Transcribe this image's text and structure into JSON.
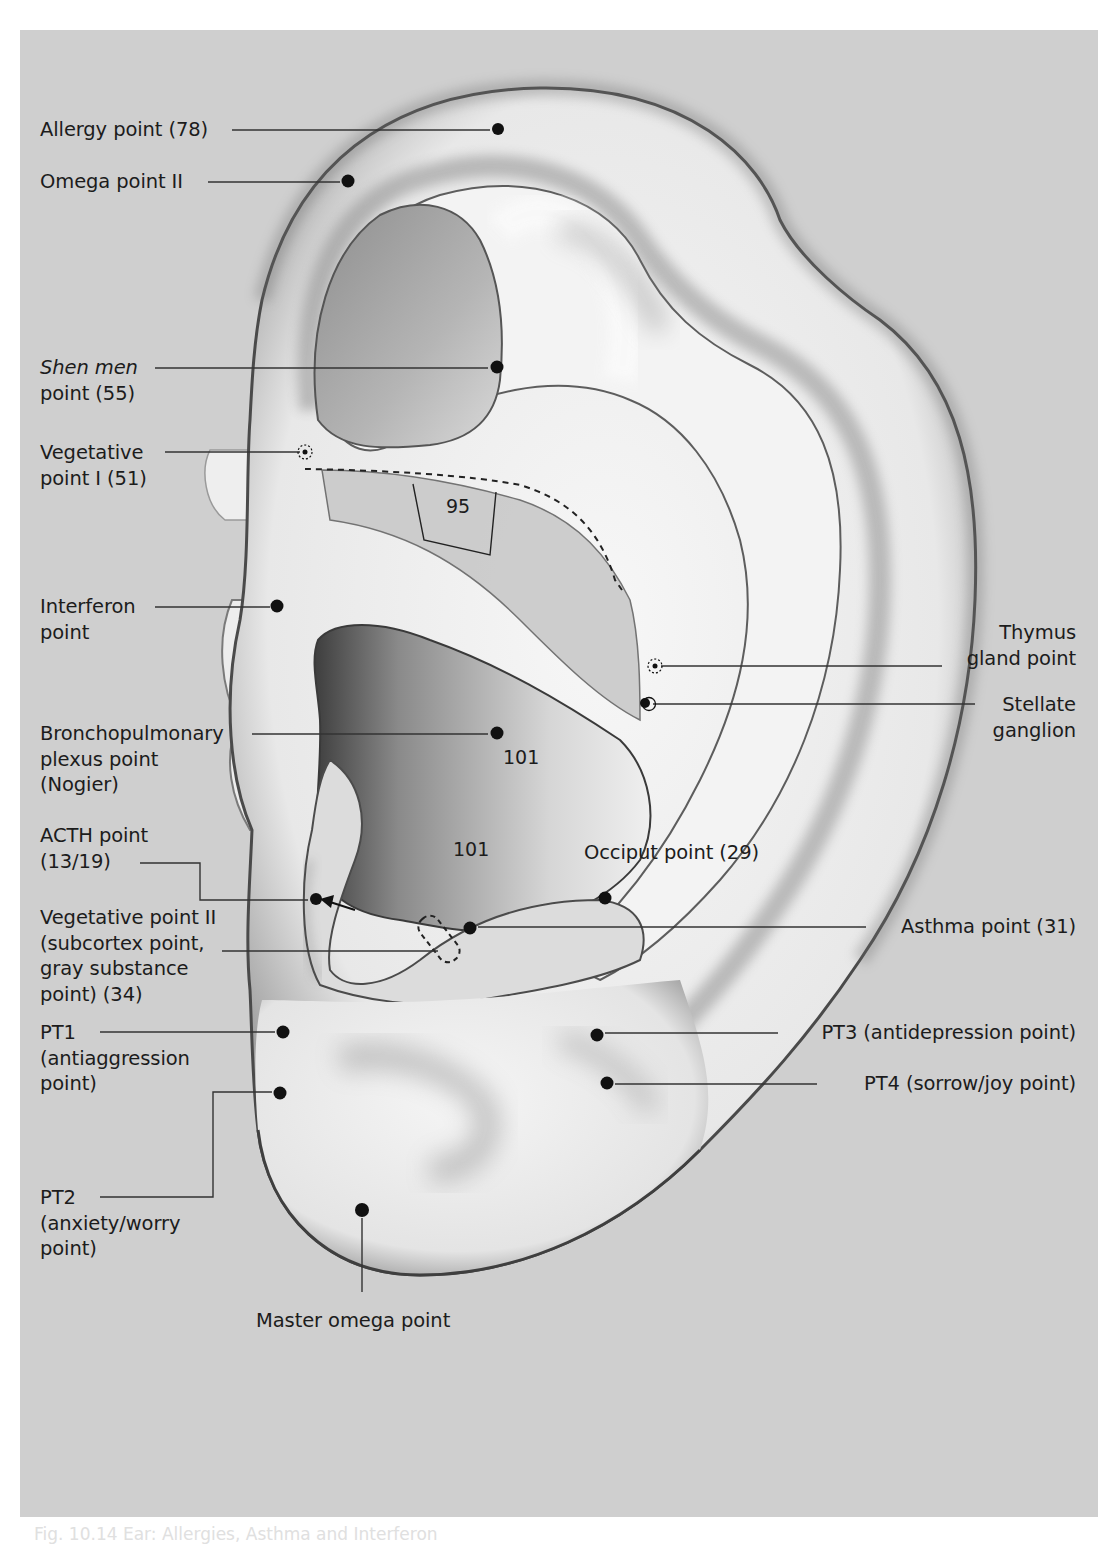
{
  "figure": {
    "background_color": "#cfcfcf",
    "point_color": "#111111",
    "caption_partial": "Fig. 10.14  Ear: Allergies, Asthma and Interferon"
  },
  "labels_left": [
    {
      "id": "allergy",
      "lines": [
        "Allergy point (78)"
      ]
    },
    {
      "id": "omega2",
      "lines": [
        "Omega point II"
      ]
    },
    {
      "id": "shenmen",
      "lines": [
        "Shen men",
        "point (55)"
      ],
      "italic_first_words": "Shen men"
    },
    {
      "id": "veg1",
      "lines": [
        "Vegetative",
        "point I (51)"
      ]
    },
    {
      "id": "interferon",
      "lines": [
        "Interferon",
        "point"
      ]
    },
    {
      "id": "broncho",
      "lines": [
        "Bronchopulmonary",
        "plexus point",
        "(Nogier)"
      ]
    },
    {
      "id": "acth",
      "lines": [
        "ACTH point",
        "(13/19)"
      ]
    },
    {
      "id": "veg2",
      "lines": [
        "Vegetative point II",
        "(subcortex point,",
        "gray substance",
        "point) (34)"
      ]
    },
    {
      "id": "pt1",
      "lines": [
        "PT1",
        "(antiaggression",
        "point)"
      ]
    },
    {
      "id": "pt2",
      "lines": [
        "PT2",
        "(anxiety/worry",
        "point)"
      ]
    }
  ],
  "labels_right": [
    {
      "id": "thymus",
      "lines": [
        "Thymus",
        "gland point"
      ]
    },
    {
      "id": "stellate",
      "lines": [
        "Stellate",
        "ganglion"
      ]
    },
    {
      "id": "asthma",
      "lines": [
        "Asthma point (31)"
      ]
    },
    {
      "id": "pt3",
      "lines": [
        "PT3 (antidepression point)"
      ]
    },
    {
      "id": "pt4",
      "lines": [
        "PT4 (sorrow/joy point)"
      ]
    }
  ],
  "labels_inner": {
    "occiput": "Occiput point (29)",
    "master_omega": "Master omega point"
  },
  "zone_numbers": {
    "zone_95": "95",
    "zone_101_upper": "101",
    "zone_101_lower": "101"
  },
  "points": [
    {
      "id": "allergy",
      "x": 498,
      "y": 129,
      "style": "solid"
    },
    {
      "id": "omega2",
      "x": 348,
      "y": 181,
      "style": "solid"
    },
    {
      "id": "shenmen",
      "x": 497,
      "y": 367,
      "style": "solid"
    },
    {
      "id": "veg1",
      "x": 305,
      "y": 452,
      "style": "dotted-ring"
    },
    {
      "id": "interferon",
      "x": 277,
      "y": 606,
      "style": "solid"
    },
    {
      "id": "thymus",
      "x": 654,
      "y": 666,
      "style": "dotted-ring"
    },
    {
      "id": "stellate",
      "x": 647,
      "y": 703,
      "style": "solid-ring"
    },
    {
      "id": "broncho",
      "x": 497,
      "y": 733,
      "style": "solid"
    },
    {
      "id": "acth",
      "x": 316,
      "y": 899,
      "style": "solid-arrow"
    },
    {
      "id": "occiput",
      "x": 605,
      "y": 898,
      "style": "solid"
    },
    {
      "id": "asthma",
      "x": 470,
      "y": 928,
      "style": "solid"
    },
    {
      "id": "pt1",
      "x": 283,
      "y": 1032,
      "style": "solid"
    },
    {
      "id": "pt2",
      "x": 280,
      "y": 1093,
      "style": "solid"
    },
    {
      "id": "pt3",
      "x": 597,
      "y": 1035,
      "style": "solid"
    },
    {
      "id": "pt4",
      "x": 607,
      "y": 1083,
      "style": "solid"
    },
    {
      "id": "master_omega",
      "x": 362,
      "y": 1210,
      "style": "solid"
    }
  ]
}
